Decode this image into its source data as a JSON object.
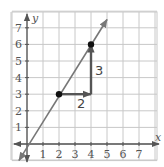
{
  "chart_data": {
    "type": "line",
    "title": "",
    "xlabel": "x",
    "ylabel": "y",
    "xlim": [
      -1,
      8
    ],
    "ylim": [
      -1,
      8
    ],
    "grid": true,
    "x_ticks": [
      "1",
      "2",
      "3",
      "4",
      "5",
      "6",
      "7"
    ],
    "y_ticks": [
      "1",
      "2",
      "3",
      "4",
      "5",
      "6",
      "7"
    ],
    "series": [
      {
        "name": "line",
        "equation": "y = 1.5x",
        "x": [
          -0.5,
          0,
          2,
          4,
          5
        ],
        "y": [
          -0.75,
          0,
          3,
          6,
          7.5
        ]
      }
    ],
    "points": [
      {
        "x": 2,
        "y": 3
      },
      {
        "x": 4,
        "y": 6
      }
    ],
    "annotations": [
      {
        "type": "run-arrow",
        "from": [
          2,
          3
        ],
        "to": [
          4,
          3
        ],
        "label": "2"
      },
      {
        "type": "rise-arrow",
        "from": [
          4,
          3
        ],
        "to": [
          4,
          6
        ],
        "label": "3"
      }
    ]
  },
  "labels": {
    "x_axis": "x",
    "y_axis": "y",
    "run": "2",
    "rise": "3",
    "x_ticks": [
      "1",
      "2",
      "3",
      "4",
      "5",
      "6",
      "7"
    ],
    "y_ticks": [
      "1",
      "2",
      "3",
      "4",
      "5",
      "6",
      "7"
    ]
  },
  "colors": {
    "grid": "#c8c8c8",
    "axis": "#555555",
    "line": "#777777",
    "arrow": "#555555",
    "point": "#111111"
  }
}
